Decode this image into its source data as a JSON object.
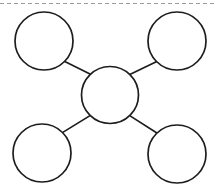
{
  "canvas": {
    "width": 216,
    "height": 193,
    "background_color": "#ffffff"
  },
  "style": {
    "stroke_color": "#1d1d1d",
    "node_fill": "#ffffff",
    "node_stroke_width": 1.7,
    "connector_stroke_width": 1.7,
    "rule_color": "#9a9a9a",
    "rule_stroke_width": 1.1,
    "rule_dash": "4 3"
  },
  "diagram": {
    "type": "node-link",
    "top_rule": {
      "name": "dashed-divider",
      "x1": 0,
      "y1": 3.5,
      "x2": 216,
      "y2": 3.5,
      "style": "dashed"
    },
    "nodes": [
      {
        "id": "center",
        "name": "center-node",
        "label": "",
        "cx": 110,
        "cy": 95,
        "r": 28.5
      },
      {
        "id": "top-left",
        "name": "node-top-left",
        "label": "",
        "cx": 44,
        "cy": 41,
        "r": 29
      },
      {
        "id": "top-right",
        "name": "node-top-right",
        "label": "",
        "cx": 177,
        "cy": 41,
        "r": 29
      },
      {
        "id": "bottom-left",
        "name": "node-bottom-left",
        "label": "",
        "cx": 42,
        "cy": 153,
        "r": 29
      },
      {
        "id": "bottom-right",
        "name": "node-bottom-right",
        "label": "",
        "cx": 177,
        "cy": 154,
        "r": 29
      }
    ],
    "edges": [
      {
        "id": "edge-center-top-left",
        "name": "connector-center-to-top-left",
        "from": "center",
        "to": "top-left",
        "x1": 90.5,
        "y1": 74.3,
        "x2": 64.3,
        "y2": 61.2
      },
      {
        "id": "edge-center-top-right",
        "name": "connector-center-to-top-right",
        "from": "center",
        "to": "top-right",
        "x1": 129.8,
        "y1": 74.6,
        "x2": 156.8,
        "y2": 61.4
      },
      {
        "id": "edge-center-bottom-left",
        "name": "connector-center-to-bottom-left",
        "from": "center",
        "to": "bottom-left",
        "x1": 90.0,
        "y1": 115.6,
        "x2": 62.8,
        "y2": 132.4
      },
      {
        "id": "edge-center-bottom-right",
        "name": "connector-center-to-bottom-right",
        "from": "center",
        "to": "bottom-right",
        "x1": 130.1,
        "y1": 115.9,
        "x2": 156.9,
        "y2": 133.0
      }
    ]
  }
}
